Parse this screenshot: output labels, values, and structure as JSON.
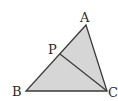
{
  "diagram": {
    "type": "triangle",
    "fill_color": "#d6d6d6",
    "stroke_color": "#3a3a3a",
    "vertices": {
      "A": {
        "label": "A",
        "x": 86,
        "y": 25
      },
      "B": {
        "label": "B",
        "x": 26,
        "y": 91
      },
      "C": {
        "label": "C",
        "x": 107,
        "y": 91
      },
      "P": {
        "label": "P",
        "x": 60,
        "y": 54
      }
    },
    "segments": [
      {
        "from": "A",
        "to": "B"
      },
      {
        "from": "B",
        "to": "C"
      },
      {
        "from": "C",
        "to": "A"
      },
      {
        "from": "P",
        "to": "C"
      }
    ],
    "labels": {
      "A": "A",
      "B": "B",
      "C": "C",
      "P": "P"
    }
  }
}
